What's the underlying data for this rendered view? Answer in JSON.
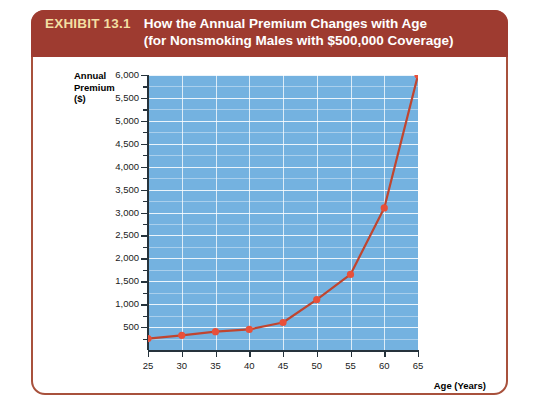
{
  "exhibit": {
    "label": "EXHIBIT 13.1",
    "title_line1": "How the Annual Premium Changes with Age",
    "title_line2": "(for Nonsmoking Males with $500,000 Coverage)",
    "header_bg": "#9e3b30",
    "label_color": "#f3dfa2",
    "border_color": "#a8513c"
  },
  "chart_data": {
    "type": "line",
    "title": "How the Annual Premium Changes with Age (for Nonsmoking Males with $500,000 Coverage)",
    "xlabel": "Age (Years)",
    "ylabel": "Annual Premium ($)",
    "ylabel_line1": "Annual",
    "ylabel_line2": "Premium",
    "ylabel_line3": "($)",
    "x": [
      25,
      30,
      35,
      40,
      45,
      50,
      55,
      60,
      65
    ],
    "values": [
      250,
      320,
      400,
      450,
      600,
      1100,
      1650,
      3100,
      6000
    ],
    "xlim": [
      25,
      65
    ],
    "ylim": [
      0,
      6000
    ],
    "xticks": [
      25,
      30,
      35,
      40,
      45,
      50,
      55,
      60,
      65
    ],
    "xtick_labels": [
      "25",
      "30",
      "35",
      "40",
      "45",
      "50",
      "55",
      "60",
      "65"
    ],
    "yticks": [
      500,
      1000,
      1500,
      2000,
      2500,
      3000,
      3500,
      4000,
      4500,
      5000,
      5500,
      6000
    ],
    "ytick_labels": [
      "500",
      "1,000",
      "1,500",
      "2,000",
      "2,500",
      "3,000",
      "3,500",
      "4,000",
      "4,500",
      "5,000",
      "5,500",
      "6,000"
    ],
    "grid": true,
    "legend": null,
    "plot_bg": "#74b2e0",
    "line_color": "#c0452f",
    "marker_color": "#e8503a",
    "gridline_color": "#ffffff"
  }
}
